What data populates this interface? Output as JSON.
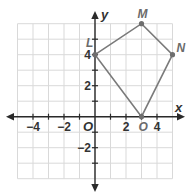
{
  "diagram": {
    "type": "coordinate-plane-polygon",
    "grid": {
      "x_min": -5,
      "x_max": 5,
      "y_min": -4,
      "y_max": 6,
      "unit_px": 15.5,
      "origin_px": [
        95,
        116.7
      ]
    },
    "axes": {
      "x_label": "x",
      "y_label": "y",
      "origin_label": "O"
    },
    "x_ticks": [
      {
        "value": -4,
        "label": "−4"
      },
      {
        "value": -2,
        "label": "−2"
      },
      {
        "value": 2,
        "label": "2"
      },
      {
        "value": 4,
        "label": "4"
      }
    ],
    "y_ticks": [
      {
        "value": 4,
        "label": "4"
      },
      {
        "value": 2,
        "label": "2"
      },
      {
        "value": -2,
        "label": "−2"
      }
    ],
    "points": [
      {
        "name": "L",
        "x": 0,
        "y": 4
      },
      {
        "name": "M",
        "x": 3,
        "y": 6
      },
      {
        "name": "N",
        "x": 5,
        "y": 4
      },
      {
        "name": "O",
        "x": 3,
        "y": 0
      }
    ],
    "polygon_order": [
      "L",
      "M",
      "N",
      "O"
    ],
    "colors": {
      "grid": "#d9d9d9",
      "axis": "#2a2a2a",
      "polygon": "#7a7a7a",
      "point_label": "#6b6b6b"
    }
  }
}
